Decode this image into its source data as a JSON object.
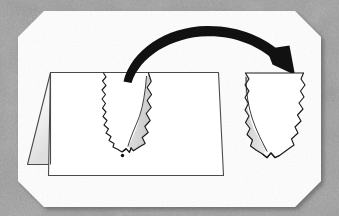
{
  "figure": {
    "background": {
      "name": "scanner-background",
      "description": "mottled gray textured scanner backdrop",
      "base_color": "#9d9d9d",
      "speckle_color_dark": "#7e7e7e",
      "speckle_color_light": "#b8b8b8"
    },
    "page": {
      "name": "scanned-page",
      "description": "white page with beveled (cut) corners",
      "fill": "#fdfdfd",
      "corner_bevel_px": 26,
      "bounds": {
        "x": 18,
        "y": 11,
        "width": 303,
        "height": 196
      },
      "shadow_color": "#6f6f6f"
    },
    "elements": {
      "folded_card": {
        "name": "folded-card",
        "description": "a card folded in half, standing open, seen in perspective",
        "back_panel": {
          "name": "card-back-panel",
          "fill_top": "#ffffff",
          "fill_bottom": "#e2e2e2",
          "stroke": "#4a4a4a"
        },
        "front_panel": {
          "name": "card-front-panel",
          "fill": "#ffffff",
          "stroke": "#4a4a4a"
        },
        "fold_line": {
          "name": "card-fold-line",
          "stroke": "#4a4a4a"
        }
      },
      "v_cut": {
        "name": "v-shaped-jagged-cut",
        "description": "jagged V-shaped cut running from the top edge of the card down to a point",
        "outline_stroke": "#1b1b1b",
        "shaded_fill": "#d8d8d8",
        "shade_side": "right"
      },
      "dot_marker": {
        "name": "dot-marker",
        "description": "small black dot below the V point",
        "fill": "#101010",
        "radius_px": 1.6
      },
      "arrow": {
        "name": "curved-transfer-arrow",
        "description": "thick black arc arrow curving left-to-right, arrowhead pointing down-right",
        "fill": "#111111",
        "direction": "left-to-right"
      },
      "cutout_piece": {
        "name": "cutout-piece",
        "description": "the removed V / triangular piece with jagged edges, straight top edge",
        "outline_stroke": "#1b1b1b",
        "shaded_fill": "#d8d8d8",
        "shade_side": "left",
        "body_fill": "#ffffff"
      }
    }
  }
}
